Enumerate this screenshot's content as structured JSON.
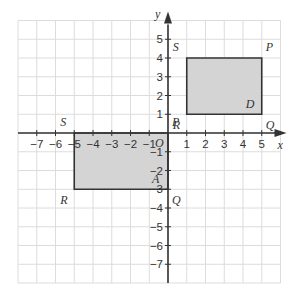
{
  "diagram": {
    "type": "coordinate-grid",
    "axes": {
      "x_label": "x",
      "y_label": "y",
      "origin_label": "O",
      "x_range": [
        -8,
        6
      ],
      "y_range": [
        -8,
        6
      ],
      "x_ticks": [
        -7,
        -6,
        -5,
        -4,
        -3,
        -2,
        -1,
        1,
        2,
        3,
        4,
        5
      ],
      "y_ticks": [
        5,
        4,
        3,
        2,
        1,
        -1,
        -2,
        -3,
        -4,
        -5,
        -6,
        -7
      ]
    },
    "shapes": [
      {
        "name": "D",
        "fill": "#d4d4d4",
        "vertices": [
          {
            "label": "P",
            "x": 5,
            "y": 4
          },
          {
            "label": "Q",
            "x": 5,
            "y": 1
          },
          {
            "label": "R",
            "x": 1,
            "y": 1
          },
          {
            "label": "S",
            "x": 1,
            "y": 4
          }
        ]
      },
      {
        "name": "A",
        "fill": "#d4d4d4",
        "vertices": [
          {
            "label": "P",
            "x": 0,
            "y": 0
          },
          {
            "label": "Q",
            "x": 0,
            "y": -3
          },
          {
            "label": "R",
            "x": -5,
            "y": -3
          },
          {
            "label": "S",
            "x": -5,
            "y": 0
          }
        ]
      }
    ],
    "colors": {
      "grid": "#dcdcdc",
      "axis": "#333333",
      "shape_fill": "#d4d4d4",
      "shape_stroke": "#333333"
    }
  }
}
